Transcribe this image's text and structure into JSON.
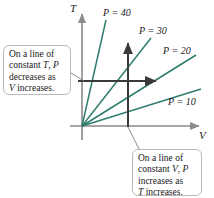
{
  "figure": {
    "axes": {
      "y_label": "T",
      "x_label": "V",
      "axis_color": "#8a8a8a",
      "origin": [
        82,
        126
      ]
    },
    "curve_color": "#2f7d6f",
    "arrow_color": "#3a3a3a",
    "isobars": [
      {
        "label": "P = 40",
        "pressure": 40,
        "slope_desc": "steepest",
        "x1": 82,
        "y1": 126,
        "x2": 106,
        "y2": 20
      },
      {
        "label": "P = 30",
        "pressure": 30,
        "slope_desc": "steep",
        "x1": 82,
        "y1": 126,
        "x2": 151,
        "y2": 38
      },
      {
        "label": "P = 20",
        "pressure": 20,
        "slope_desc": "moderate",
        "x1": 82,
        "y1": 126,
        "x2": 196,
        "y2": 55
      },
      {
        "label": "P = 10",
        "pressure": 10,
        "slope_desc": "shallowest",
        "x1": 82,
        "y1": 126,
        "x2": 201,
        "y2": 89
      }
    ],
    "annotation_arrows": [
      {
        "name": "constant-T-arrow",
        "direction": "right",
        "x1": 78,
        "y1": 81,
        "x2": 158,
        "y2": 81
      },
      {
        "name": "constant-V-arrow",
        "direction": "up",
        "x1": 128,
        "y1": 127,
        "x2": 128,
        "y2": 41
      }
    ],
    "callouts": {
      "left": {
        "line1": "On a line of",
        "line2_pre": "constant ",
        "line2_var1": "T",
        "line2_mid": ", ",
        "line2_var2": "P",
        "line3": "decreases as",
        "line4_var": "V",
        "line4_post": " increases."
      },
      "bottom": {
        "line1": "On a line of",
        "line2_pre": "constant ",
        "line2_var1": "V",
        "line2_mid": ", ",
        "line2_var2": "P",
        "line3": "increases as",
        "line4_var": "T",
        "line4_post": " increases."
      }
    }
  }
}
